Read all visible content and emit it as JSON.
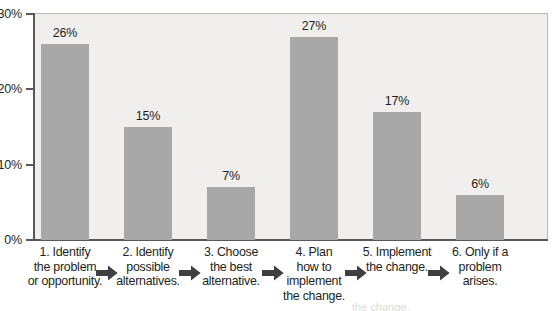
{
  "chart_data": {
    "type": "bar",
    "title": "",
    "subtitle": "",
    "xlabel": "",
    "ylabel": "",
    "orientation": "vertical",
    "grid": false,
    "legend": false,
    "legend_position": "none",
    "ylim": [
      0,
      30
    ],
    "y_ticks": [
      0,
      10,
      20,
      30
    ],
    "y_tick_labels": [
      "0%",
      "10%",
      "20%",
      "30%"
    ],
    "bar_color": "#a8a8a8",
    "plot_background": "#f0efed",
    "axis_color": "#58585a",
    "value_suffix": "%",
    "categories": [
      "1. Identify the problem or opportunity.",
      "2. Identify possible alternatives.",
      "3. Choose the best alternative.",
      "4. Plan how to implement the change.",
      "5. Implement the change.",
      "6. Only if a problem arises."
    ],
    "category_lines": [
      [
        "1. Identify",
        "the problem",
        "or opportunity."
      ],
      [
        "2. Identify",
        "possible",
        "alternatives."
      ],
      [
        "3. Choose",
        "the best",
        "alternative."
      ],
      [
        "4. Plan",
        "how to",
        "implement",
        "the change."
      ],
      [
        "5. Implement",
        "the change."
      ],
      [
        "6. Only if a",
        "problem",
        "arises."
      ]
    ],
    "values": [
      26,
      15,
      7,
      27,
      17,
      6
    ],
    "value_labels": [
      "26%",
      "15%",
      "7%",
      "27%",
      "17%",
      "6%"
    ],
    "flow_arrows": 5,
    "flow_arrow_icon": "arrow-right-icon"
  },
  "page_bleed": {
    "text": "the change."
  }
}
